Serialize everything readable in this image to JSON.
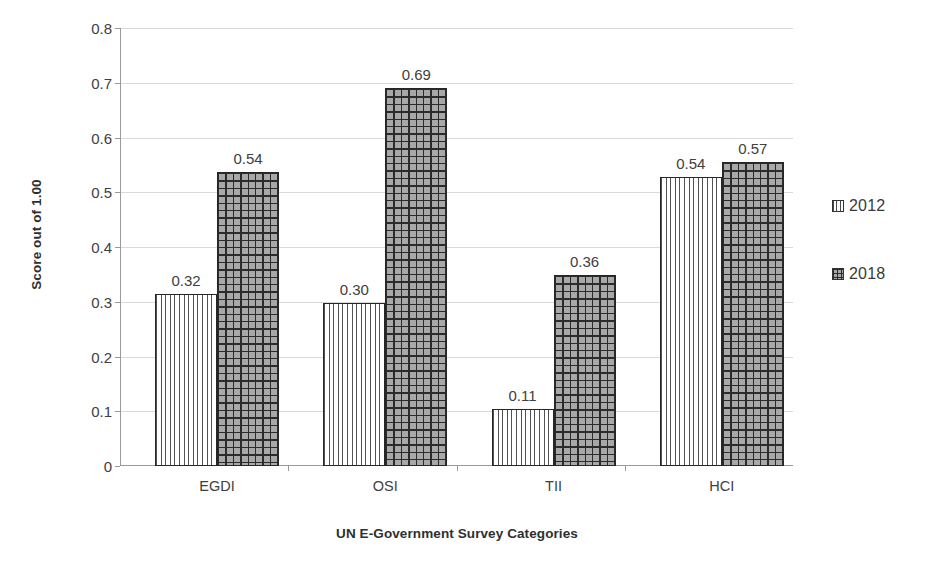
{
  "chart_data": {
    "type": "bar",
    "title": "",
    "xlabel": "UN E-Government Survey Categories",
    "ylabel": "Score out of 1.00",
    "categories": [
      "EGDI",
      "OSI",
      "TII",
      "HCI"
    ],
    "ylim": [
      0,
      0.8
    ],
    "ytick_labels": [
      "0.8",
      "0.7",
      "0.6",
      "0.5",
      "0.4",
      "0.3",
      "0.2",
      "0.1",
      "0"
    ],
    "ytick_values": [
      0.8,
      0.7,
      0.6,
      0.5,
      0.4,
      0.3,
      0.2,
      0.1,
      0
    ],
    "grid": true,
    "legend_position": "right",
    "series": [
      {
        "name": "2012",
        "pattern": "vertical-lines",
        "values": [
          0.315,
          0.297,
          0.104,
          0.527
        ],
        "labels": [
          "0.32",
          "0.30",
          "0.11",
          "0.54"
        ]
      },
      {
        "name": "2018",
        "pattern": "crosshatch-grid",
        "values": [
          0.537,
          0.69,
          0.349,
          0.556
        ],
        "labels": [
          "0.54",
          "0.69",
          "0.36",
          "0.57"
        ]
      }
    ]
  },
  "legend": {
    "items": [
      {
        "label": "2012",
        "swatch": "vertical-lines-swatch"
      },
      {
        "label": "2018",
        "swatch": "crosshatch-grid-swatch"
      }
    ]
  },
  "colors": {
    "series_2012_fill": "#ffffff",
    "series_2012_lines": "#525252",
    "series_2018_fill": "#a8a8a8",
    "series_2018_lines": "#2b2b2b",
    "bar_border": "#262626",
    "gridline": "#d9d9d9",
    "axis_line": "#9a9a9a",
    "text": "#404040"
  }
}
